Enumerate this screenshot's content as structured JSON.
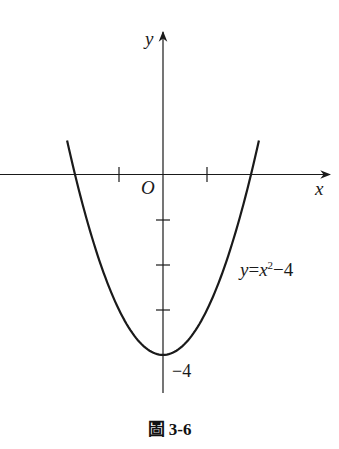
{
  "chart_data": {
    "type": "line",
    "title": "",
    "xlabel": "x",
    "ylabel": "y",
    "origin_label": "O",
    "series": [
      {
        "name": "y=x²−4",
        "equation": "y = x^2 - 4",
        "x": [
          -2.2,
          -2,
          -1.5,
          -1,
          -0.5,
          0,
          0.5,
          1,
          1.5,
          2,
          2.2
        ],
        "y": [
          0.84,
          0,
          -1.75,
          -3,
          -3.75,
          -4,
          -3.75,
          -3,
          -1.75,
          0,
          0.84
        ]
      }
    ],
    "x_ticks": [
      -1,
      1
    ],
    "y_ticks": [
      -1,
      -2,
      -3,
      -4
    ],
    "annotations": [
      {
        "text": "−4",
        "at": [
          0,
          -4
        ]
      },
      {
        "text": "y=x²−4",
        "at": [
          2,
          -2.5
        ]
      }
    ],
    "grid": false,
    "xlim": [
      -3.7,
      3.8
    ],
    "ylim": [
      -4.9,
      2.1
    ]
  },
  "labels": {
    "y_axis": "y",
    "x_axis": "x",
    "origin": "O",
    "minus_four": "−4",
    "curve_eq_y": "y",
    "curve_eq_eq": "=",
    "curve_eq_x": "x",
    "curve_eq_sup": "2",
    "curve_eq_rest": "−4"
  },
  "caption": "圖 3-6"
}
